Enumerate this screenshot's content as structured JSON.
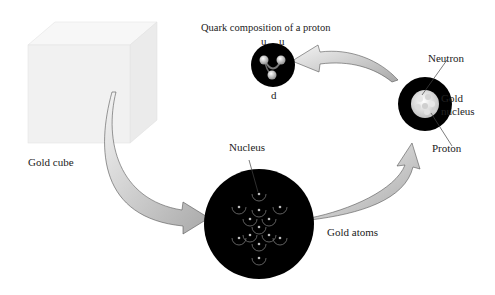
{
  "diagram": {
    "title": "Quark composition of a proton",
    "labels": {
      "gold_cube": "Gold cube",
      "nucleus": "Nucleus",
      "gold_atoms": "Gold atoms",
      "neutron": "Neutron",
      "gold_nucleus_line1": "Gold",
      "gold_nucleus_line2": "nucleus",
      "proton": "Proton",
      "quark_u1": "u",
      "quark_u2": "u",
      "quark_d": "d"
    },
    "flow": [
      "Gold cube",
      "Gold atoms",
      "Gold nucleus",
      "Quark composition of a proton"
    ],
    "colors": {
      "circle_fill": "#000000",
      "arrow_fill": "#c8c8c8",
      "cube_fill": "#f2f2f2"
    }
  }
}
